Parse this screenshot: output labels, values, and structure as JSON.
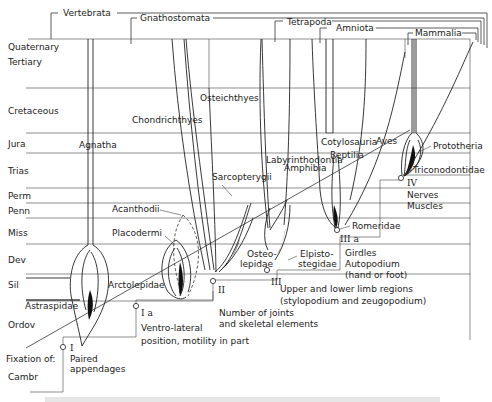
{
  "diagram": {
    "periods": [
      "Quaternary",
      "Tertiary",
      "Cretaceous",
      "Jura",
      "Trias",
      "Perm",
      "Penn",
      "Miss",
      "Dev",
      "Sil",
      "Ordov",
      "Cambr"
    ],
    "top_groups": {
      "vertebrata": "Vertebrata",
      "gnathostomata": "Gnathostomata",
      "tetrapoda": "Tetrapoda",
      "amniota": "Amniota",
      "mammalia": "Mammalia"
    },
    "taxa": {
      "agnatha": "Agnatha",
      "chondrichthyes": "Chondrichthyes",
      "osteichthyes": "Osteichthyes",
      "amphibia": "Amphibia",
      "reptilia": "Reptilia",
      "aves": "Aves",
      "sarcopterygii": "Sarcopterygii",
      "labyrinthodontia": "Labyrinthodontia",
      "cotylosauria": "Cotylosauria",
      "prototheria": "Prototheria",
      "triconodontidae": "Triconodontidae",
      "acanthodii": "Acanthodii",
      "placodermi": "Placodermi",
      "arctolepidae": "Arctolepidae",
      "astraspidae": "Astraspidae",
      "osteolepidae_1": "Osteo-",
      "osteolepidae_2": "lepidae",
      "elpistostegidae_1": "Elpisto-",
      "elpistostegidae_2": "stegidae",
      "romeridae": "Romeridae"
    },
    "stages": {
      "fixation_label": "Fixation of:",
      "I": {
        "numeral": "I",
        "line1": "Paired",
        "line2": "appendages"
      },
      "Ia": {
        "numeral": "I a",
        "line1": "Ventro-lateral",
        "line2": "position, motility in part"
      },
      "II": {
        "numeral": "II",
        "line1": "Number of joints",
        "line2": "and skeletal elements"
      },
      "III": {
        "numeral": "III",
        "line1": "Upper and lower limb regions",
        "line2": "(stylopodium and zeugopodium)"
      },
      "IIIa": {
        "numeral": "III a",
        "line1": "Girdles",
        "line2": "Autopodium",
        "line3": "(hand or foot)"
      },
      "IV": {
        "numeral": "IV",
        "line1": "Nerves",
        "line2": "Muscles"
      }
    }
  }
}
